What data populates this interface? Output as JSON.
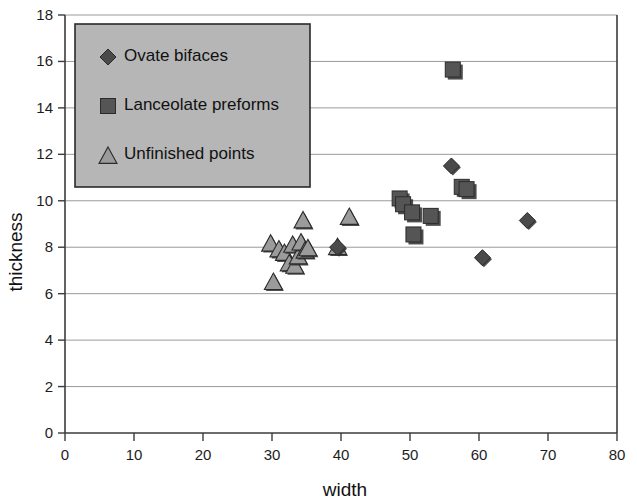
{
  "chart_data": {
    "type": "scatter",
    "title": "",
    "xlabel": "width",
    "ylabel": "thickness",
    "xlim": [
      0,
      80
    ],
    "ylim": [
      0,
      18
    ],
    "xticks": [
      0,
      10,
      20,
      30,
      40,
      50,
      60,
      70,
      80
    ],
    "yticks": [
      0,
      2,
      4,
      6,
      8,
      10,
      12,
      14,
      16,
      18
    ],
    "grid": "horizontal",
    "legend_position": "upper-left-inside",
    "series": [
      {
        "name": "Ovate bifaces",
        "marker": "diamond",
        "color": "#4a4a4a",
        "points": [
          {
            "x": 39.5,
            "y": 8.0
          },
          {
            "x": 56.0,
            "y": 11.5
          },
          {
            "x": 60.5,
            "y": 7.55
          },
          {
            "x": 67.0,
            "y": 9.15
          }
        ]
      },
      {
        "name": "Lanceolate preforms",
        "marker": "square",
        "color": "#555555",
        "points": [
          {
            "x": 48.5,
            "y": 10.1
          },
          {
            "x": 49.0,
            "y": 9.85
          },
          {
            "x": 50.3,
            "y": 9.5
          },
          {
            "x": 50.5,
            "y": 8.55
          },
          {
            "x": 53.0,
            "y": 9.35
          },
          {
            "x": 56.2,
            "y": 15.65
          },
          {
            "x": 57.5,
            "y": 10.6
          },
          {
            "x": 58.2,
            "y": 10.5
          }
        ]
      },
      {
        "name": "Unfinished points",
        "marker": "triangle",
        "color": "#9b9b9b",
        "points": [
          {
            "x": 29.8,
            "y": 8.15
          },
          {
            "x": 30.2,
            "y": 6.5
          },
          {
            "x": 31.0,
            "y": 7.9
          },
          {
            "x": 31.8,
            "y": 7.75
          },
          {
            "x": 32.5,
            "y": 7.3
          },
          {
            "x": 33.0,
            "y": 8.1
          },
          {
            "x": 33.3,
            "y": 7.2
          },
          {
            "x": 33.8,
            "y": 7.6
          },
          {
            "x": 34.2,
            "y": 8.2
          },
          {
            "x": 34.5,
            "y": 9.15
          },
          {
            "x": 34.8,
            "y": 7.85
          },
          {
            "x": 35.2,
            "y": 7.95
          },
          {
            "x": 39.5,
            "y": 8.0
          },
          {
            "x": 41.2,
            "y": 9.3
          }
        ]
      }
    ],
    "legend_entries": [
      {
        "label": "Ovate bifaces",
        "marker": "diamond"
      },
      {
        "label": "Lanceolate preforms",
        "marker": "square"
      },
      {
        "label": "Unfinished points",
        "marker": "triangle"
      }
    ]
  },
  "axis": {
    "x_title": "width",
    "y_title": "thickness"
  }
}
